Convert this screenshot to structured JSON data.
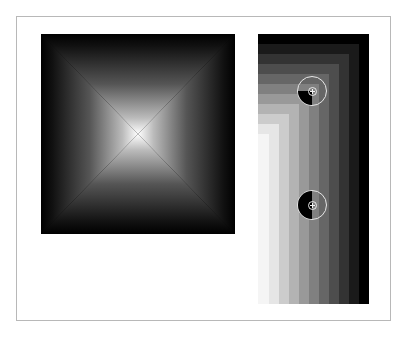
{
  "diagram": {
    "pyramid_gradient": {
      "description": "square radial-pyramid gradient, white center to black edges",
      "center_color": "#ffffff",
      "edge_color": "#000000"
    },
    "step_gradient": {
      "description": "nested L-shaped grayscale bands, lighter toward bottom-left",
      "band_colors": [
        "#000000",
        "#1a1a1a",
        "#333333",
        "#4d4d4d",
        "#666666",
        "#808080",
        "#999999",
        "#b3b3b3",
        "#cccccc",
        "#e6e6e6",
        "#f5f5f5"
      ],
      "band_size_px": 10
    },
    "markers": [
      {
        "id": "marker-1",
        "shape": "circle-with-crosshair",
        "fill": "bottom-left-quarter",
        "fill_color": "#000000",
        "ring_color": "#e6e6e6"
      },
      {
        "id": "marker-2",
        "shape": "circle-with-crosshair",
        "fill": "left-half",
        "fill_color": "#000000",
        "ring_color": "#e6e6e6"
      }
    ]
  },
  "colors": {
    "frame_border": "#b8b8b8",
    "background": "#ffffff"
  }
}
